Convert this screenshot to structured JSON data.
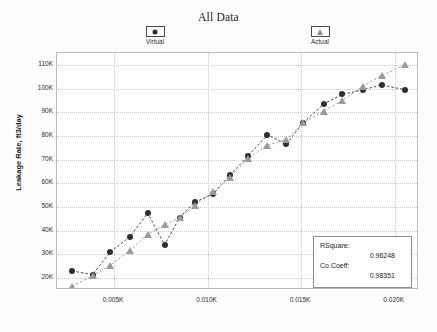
{
  "title": "All Data",
  "legend": {
    "position": "top",
    "items": [
      {
        "label": "Virtual",
        "marker": "circle-marker-icon",
        "color": "#2e2e3a"
      },
      {
        "label": "Actual",
        "marker": "triangle-marker-icon",
        "color": "#9a9a9a"
      }
    ]
  },
  "axes": {
    "ylabel": "Leakage Rate, ft3/day",
    "xlabel": "",
    "yticks": [
      "20K",
      "30K",
      "40K",
      "50K",
      "60K",
      "70K",
      "80K",
      "90K",
      "100K",
      "110K"
    ],
    "xticks": [
      "0.005K",
      "0.010K",
      "0.015K",
      "0.020K"
    ]
  },
  "stats": {
    "rsquare_label": "RSquare:",
    "rsquare_value": "0.96248",
    "cocoeff_label": "Co.Coeff:",
    "cocoeff_value": "0.98351"
  },
  "chart_data": {
    "type": "scatter",
    "title": "All Data",
    "xlabel": "",
    "ylabel": "Leakage Rate, ft3/day",
    "grid": true,
    "legend_position": "top",
    "xlim": [
      0.00195,
      0.0213
    ],
    "ylim": [
      15000,
      115000
    ],
    "xtick_values": [
      0.005,
      0.01,
      0.015,
      0.02
    ],
    "xtick_labels": [
      "0.005K",
      "0.010K",
      "0.015K",
      "0.020K"
    ],
    "ytick_values": [
      20000,
      30000,
      40000,
      50000,
      60000,
      70000,
      80000,
      90000,
      100000,
      110000
    ],
    "ytick_labels": [
      "20K",
      "30K",
      "40K",
      "50K",
      "60K",
      "70K",
      "80K",
      "90K",
      "100K",
      "110K"
    ],
    "series": [
      {
        "name": "Virtual",
        "marker": "circle",
        "color": "#2e2e3a",
        "linestyle": "dashed",
        "x": [
          0.00275,
          0.00385,
          0.0048,
          0.00585,
          0.0068,
          0.0077,
          0.0085,
          0.0093,
          0.0103,
          0.0112,
          0.01215,
          0.0132,
          0.0142,
          0.0151,
          0.0162,
          0.0172,
          0.0183,
          0.0193,
          0.02055
        ],
        "y": [
          23000,
          21500,
          31000,
          37500,
          47500,
          34000,
          45500,
          52000,
          55500,
          63500,
          71500,
          80500,
          76500,
          85500,
          93500,
          97500,
          99500,
          101500,
          99500
        ]
      },
      {
        "name": "Actual",
        "marker": "triangle",
        "color": "#9a9a9a",
        "linestyle": "dashed",
        "x": [
          0.00275,
          0.00385,
          0.0048,
          0.00585,
          0.0068,
          0.0077,
          0.0085,
          0.0093,
          0.0103,
          0.0112,
          0.01215,
          0.0132,
          0.0142,
          0.0151,
          0.0162,
          0.0172,
          0.0183,
          0.0193,
          0.02055
        ],
        "y": [
          16500,
          21000,
          25500,
          31500,
          38500,
          42500,
          45500,
          50500,
          56500,
          62500,
          70500,
          76000,
          78500,
          85500,
          90500,
          95000,
          101000,
          105500,
          110000
        ]
      }
    ]
  }
}
